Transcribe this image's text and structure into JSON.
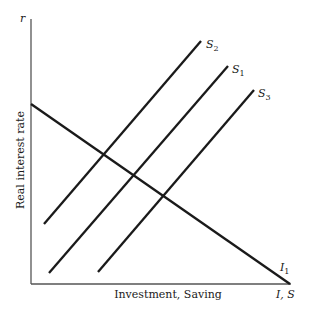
{
  "diagram": {
    "y_axis": {
      "symbol": "r",
      "label": "Real interest rate"
    },
    "x_axis": {
      "label": "Investment, Saving",
      "symbol": "I, S"
    },
    "curves": {
      "investment": {
        "label": "I",
        "subscript": "1"
      },
      "saving_2": {
        "label": "S",
        "subscript": "2"
      },
      "saving_1": {
        "label": "S",
        "subscript": "1"
      },
      "saving_3": {
        "label": "S",
        "subscript": "3"
      }
    },
    "colors": {
      "line": "#1a1a1a",
      "axis": "#555555",
      "background": "#ffffff"
    }
  }
}
